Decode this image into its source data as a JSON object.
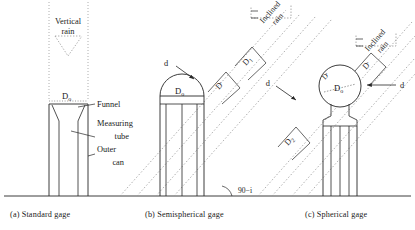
{
  "figure": {
    "background": "#ffffff",
    "ink": "#262626",
    "dash_ink": "#8a8a8a"
  },
  "panels": [
    {
      "id": "a",
      "caption": "(a)  Standard gage",
      "rain_type": "Vertical rain",
      "rain_label": [
        "Vertical",
        "rain"
      ],
      "parts": [
        {
          "name": "funnel",
          "label": "Funnel"
        },
        {
          "name": "measuring-tube",
          "label": [
            "Measuring",
            "tube"
          ]
        },
        {
          "name": "outer-can",
          "label": [
            "Outer",
            "can"
          ]
        }
      ],
      "dimensions": [
        {
          "name": "orifice-diameter",
          "label": "D",
          "sub": "o"
        }
      ]
    },
    {
      "id": "b",
      "caption": "(b)  Semispherical gage",
      "rain_type": "Inclined rain",
      "rain_label": [
        "Inclined",
        "rain"
      ],
      "dimensions": [
        {
          "name": "dome-diameter",
          "label": "D",
          "sub": "o"
        },
        {
          "name": "projected-width",
          "label": "D",
          "sub": "'"
        },
        {
          "name": "band-width-1",
          "label": "D",
          "sub": "1"
        },
        {
          "name": "drop-size",
          "label": "d"
        }
      ],
      "angle": {
        "name": "incidence-angle",
        "label": "90−i"
      }
    },
    {
      "id": "c",
      "caption": "(c) Spherical gage",
      "rain_type": "Inclined rain",
      "rain_label": [
        "Inclined",
        "rain"
      ],
      "dimensions": [
        {
          "name": "sphere-diameter",
          "label": "D",
          "sub": "o"
        },
        {
          "name": "sphere-projected",
          "label": "D",
          "sub": "'"
        },
        {
          "name": "projected-width",
          "label": "D",
          "sub": "'"
        },
        {
          "name": "band-width-2",
          "label": "D",
          "sub": "2"
        },
        {
          "name": "drop-size-left",
          "label": "d"
        },
        {
          "name": "drop-size-right",
          "label": "d"
        }
      ]
    }
  ],
  "labels": {
    "Do": "D",
    "Do_sub": "o",
    "Dprime": "D",
    "Dprime_sub": "'",
    "D1": "D",
    "D1_sub": "1",
    "D2": "D",
    "D2_sub": "2",
    "d": "d",
    "angle": "90−i",
    "funnel": "Funnel",
    "measuring1": "Measuring",
    "measuring2": "tube",
    "outer1": "Outer",
    "outer2": "can",
    "vertical1": "Vertical",
    "vertical2": "rain",
    "inclined1": "Inclined",
    "inclined2": "rain",
    "capA": "(a)  Standard gage",
    "capB": "(b)  Semispherical gage",
    "capC": "(c) Spherical gage"
  }
}
